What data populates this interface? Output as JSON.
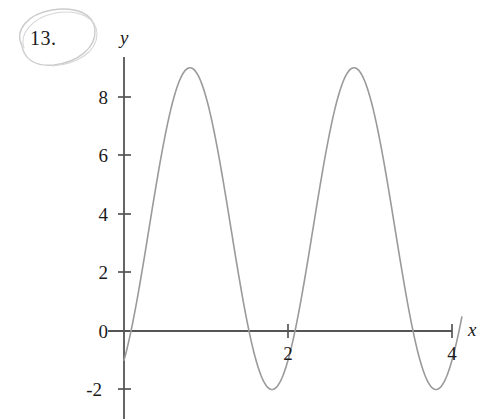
{
  "figure": {
    "problem_number": "13.",
    "annotation_shape": "hand-drawn-ellipse",
    "background_color": "#ffffff"
  },
  "colors": {
    "curve": "#9a9a9a",
    "axis": "#555555",
    "text": "#1a1a1a",
    "pencil_annotation": "#c9c9c9"
  },
  "chart_data": {
    "type": "line",
    "title": "",
    "subtitle": "",
    "xlabel": "x",
    "ylabel": "y",
    "grid": false,
    "legend": null,
    "xlim": [
      -0.05,
      4.5
    ],
    "ylim": [
      -2.8,
      9.6
    ],
    "xticks": [
      2,
      4
    ],
    "xtick_labels": [
      "2",
      "4"
    ],
    "yticks": [
      -2,
      0,
      2,
      4,
      6,
      8
    ],
    "ytick_labels": [
      "-2",
      "0",
      "2",
      "4",
      "6",
      "8"
    ],
    "axis_origin": [
      0,
      0
    ],
    "series": [
      {
        "name": "curve",
        "description": "sinusoid, amplitude 5.5 about midline 3.5, period 2",
        "amplitude": 5.5,
        "midline": 3.5,
        "period": 2,
        "maximum": 9,
        "minimum": -2,
        "x_intercepts": [
          0.055,
          1.49,
          2.145,
          3.51
        ],
        "peaks_x": [
          0.805,
          2.84
        ],
        "valleys_x": [
          1.805,
          3.8
        ],
        "x": [
          0.0,
          0.1,
          0.2,
          0.3,
          0.4,
          0.5,
          0.6,
          0.7,
          0.8,
          0.9,
          1.0,
          1.1,
          1.2,
          1.3,
          1.4,
          1.5,
          1.6,
          1.7,
          1.8,
          1.9,
          2.0,
          2.1,
          2.2,
          2.3,
          2.4,
          2.5,
          2.6,
          2.7,
          2.8,
          2.9,
          3.0,
          3.1,
          3.2,
          3.3,
          3.4,
          3.5,
          3.6,
          3.7,
          3.8,
          3.9,
          4.0,
          4.1
        ],
        "y": [
          -2.0,
          -1.15,
          1.2,
          4.2,
          6.93,
          8.58,
          8.93,
          7.89,
          5.79,
          3.14,
          0.5,
          -1.56,
          -2.0,
          -1.89,
          -0.07,
          2.57,
          5.33,
          7.62,
          8.88,
          8.83,
          7.5,
          5.22,
          2.52,
          0.1,
          -1.42,
          -1.99,
          -1.31,
          0.4,
          2.99,
          5.75,
          8.0,
          8.93,
          8.6,
          6.87,
          4.31,
          1.5,
          -0.75,
          -1.9,
          -2.0,
          -1.3,
          0.55,
          3.0
        ]
      }
    ]
  },
  "axis_geometry": {
    "origin_px": [
      124,
      331
    ],
    "x_unit_px": 82,
    "y_unit_px": 29.25
  }
}
